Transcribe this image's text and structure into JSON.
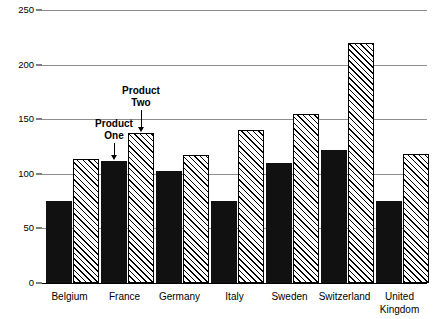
{
  "chart_data": {
    "type": "bar",
    "title": "",
    "xlabel": "",
    "ylabel": "",
    "ylim": [
      0,
      250
    ],
    "yticks": [
      0,
      50,
      100,
      150,
      200,
      250
    ],
    "grid": true,
    "legend_position": "inline-annotation",
    "categories": [
      "Belgium",
      "France",
      "Germany",
      "Italy",
      "Sweden",
      "Switzerland",
      "United\nKingdom"
    ],
    "series": [
      {
        "name": "Product One",
        "style": "solid-black",
        "values": [
          75,
          112,
          103,
          75,
          110,
          122,
          75
        ]
      },
      {
        "name": "Product Two",
        "style": "diagonal-hatch",
        "values": [
          114,
          137,
          117,
          140,
          155,
          220,
          118
        ]
      }
    ],
    "annotations": [
      {
        "label": "Product\nOne",
        "points_to": "France / Product One bar"
      },
      {
        "label": "Product\nTwo",
        "points_to": "France / Product Two bar"
      }
    ],
    "colors": {
      "series_one": "#111111",
      "series_two_fill": "#ffffff",
      "series_two_hatch": "#000000",
      "gridline": "#8d8d8d",
      "axis": "#000000",
      "background": "#ffffff"
    }
  },
  "axis": {
    "y_tick_labels": [
      "0",
      "50",
      "100",
      "150",
      "200",
      "250"
    ]
  },
  "categories_display": [
    "Belgium",
    "France",
    "Germany",
    "Italy",
    "Sweden",
    "Switzerland",
    "United\nKingdom"
  ],
  "annotations_display": {
    "product_one": "Product\nOne",
    "product_two": "Product\nTwo"
  }
}
